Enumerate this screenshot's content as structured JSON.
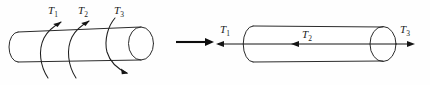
{
  "figure": {
    "background_color": "#fefefe",
    "line_color": "#2b2b2b",
    "label_color": "#1a1a1a",
    "width": 430,
    "height": 85
  },
  "left_panel": {
    "name": "applied-torque-shaft",
    "description": "Circular shaft drawn in perspective with three applied torques shown as helical curved arrows wrapping around the shaft",
    "labels": [
      {
        "id": "T1",
        "base": "T",
        "sub": "1",
        "x": 52,
        "y": 13,
        "direction": "counterclockwise",
        "arrow": "up-right"
      },
      {
        "id": "T2",
        "base": "T",
        "sub": "2",
        "x": 82,
        "y": 13,
        "direction": "counterclockwise",
        "arrow": "up-right"
      },
      {
        "id": "T3",
        "base": "T",
        "sub": "3",
        "x": 118,
        "y": 13,
        "direction": "clockwise",
        "arrow": "down-right"
      }
    ]
  },
  "transition": {
    "name": "equivalence-arrow",
    "symbol": "→",
    "meaning": "is equivalent to",
    "x_start": 176,
    "x_end": 214,
    "y": 42
  },
  "right_panel": {
    "name": "torque-vector-shaft",
    "description": "Same circular shaft with torques represented as straight double-headed vectors along the shaft axis using the right-hand rule",
    "labels": [
      {
        "id": "T1",
        "base": "T",
        "sub": "1",
        "x": 224,
        "y": 32,
        "direction": "left",
        "arrow": "left"
      },
      {
        "id": "T2",
        "base": "T",
        "sub": "2",
        "x": 306,
        "y": 37,
        "direction": "left",
        "arrow": "left"
      },
      {
        "id": "T3",
        "base": "T",
        "sub": "3",
        "x": 404,
        "y": 32,
        "direction": "right",
        "arrow": "right"
      }
    ]
  }
}
